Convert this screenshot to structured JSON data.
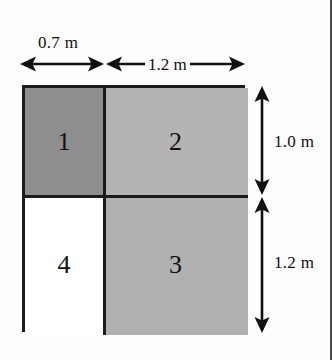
{
  "figure": {
    "ghost_text_top": "",
    "ghost_text_bottom": ""
  },
  "diagram": {
    "type": "dimensioned-rectangle",
    "regions": [
      {
        "id": "1",
        "label": "1",
        "fill": "#8e8e8e",
        "width_m": 0.7,
        "height_m": 1.0,
        "position": "top-left"
      },
      {
        "id": "2",
        "label": "2",
        "fill": "#b4b4b4",
        "width_m": 1.2,
        "height_m": 1.0,
        "position": "top-right"
      },
      {
        "id": "3",
        "label": "3",
        "fill": "#b0b0b0",
        "width_m": 1.2,
        "height_m": 1.2,
        "position": "bottom-right"
      },
      {
        "id": "4",
        "label": "4",
        "fill": "#ffffff",
        "width_m": 0.7,
        "height_m": 1.2,
        "position": "bottom-left"
      }
    ],
    "dimensions": {
      "top_left": "0.7 m",
      "top_right": "1.2 m",
      "right_top": "1.0 m",
      "right_bottom": "1.2 m"
    },
    "colors": {
      "outline": "#1b1b1b",
      "background": "#fdfdfd",
      "text": "#101010"
    }
  }
}
